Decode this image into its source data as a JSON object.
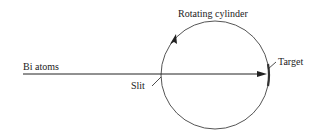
{
  "diagram": {
    "type": "apparatus-schematic",
    "labels": {
      "beam": "Bi atoms",
      "cylinder": "Rotating cylinder",
      "slit": "Slit",
      "target": "Target"
    },
    "colors": {
      "line": "#222222",
      "circle": "#555555",
      "target": "#333333"
    }
  }
}
